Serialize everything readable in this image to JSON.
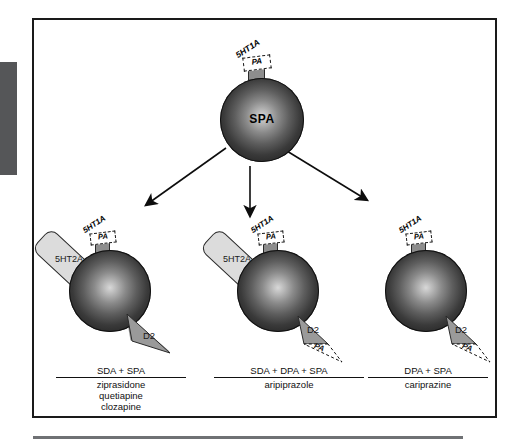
{
  "figure": {
    "central": {
      "sphere_label": "SPA",
      "stalk_top_label": "5HT1A",
      "stalk_pa_label": "PA"
    },
    "branches": [
      {
        "id": "left",
        "sphere_label": "",
        "stalk_top_label": "5HT1A",
        "stalk_pa_label": "PA",
        "ht2a_label": "5HT2A",
        "d2_label": "D2",
        "d2_pa_label": "",
        "caption_title": "SDA + SPA",
        "drugs": [
          "ziprasidone",
          "quetiapine",
          "clozapine"
        ]
      },
      {
        "id": "middle",
        "sphere_label": "",
        "stalk_top_label": "5HT1A",
        "stalk_pa_label": "PA",
        "ht2a_label": "5HT2A",
        "d2_label": "D2",
        "d2_pa_label": "PA",
        "caption_title": "SDA + DPA + SPA",
        "drugs": [
          "aripiprazole"
        ]
      },
      {
        "id": "right",
        "sphere_label": "",
        "stalk_top_label": "5HT1A",
        "stalk_pa_label": "PA",
        "ht2a_label": "",
        "d2_label": "D2",
        "d2_pa_label": "PA",
        "caption_title": "DPA + SPA",
        "drugs": [
          "cariprazine"
        ]
      }
    ],
    "colors": {
      "sphere_dark": "#1c1c1c",
      "sphere_light": "#d8d8d8",
      "receptor_gray": "#9a9a9a",
      "ht2a_gray": "#dcdcdc",
      "frame_border": "#1a1a1a",
      "side_tab": "#555658"
    }
  }
}
